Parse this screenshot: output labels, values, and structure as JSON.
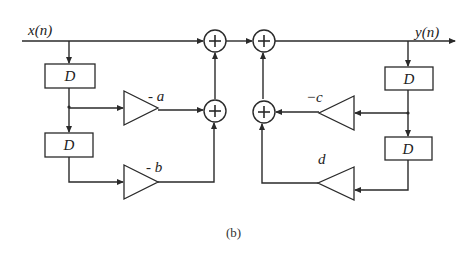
{
  "diagram": {
    "type": "block-diagram",
    "input_label": "x(n)",
    "output_label": "y(n)",
    "caption": "(b)",
    "delay_label": "D",
    "feedforward": {
      "delays": [
        "D",
        "D"
      ],
      "gains": [
        "- a",
        "- b"
      ]
    },
    "feedback": {
      "delays": [
        "D",
        "D"
      ],
      "gains": [
        "−c",
        "d"
      ]
    },
    "adder_symbol": "+",
    "nodes": [
      {
        "id": "adder-1",
        "kind": "adder"
      },
      {
        "id": "adder-2",
        "kind": "adder"
      },
      {
        "id": "adder-3",
        "kind": "adder"
      },
      {
        "id": "adder-4",
        "kind": "adder"
      }
    ],
    "colors": {
      "stroke": "#2a2a2a",
      "background": "#ffffff"
    }
  }
}
